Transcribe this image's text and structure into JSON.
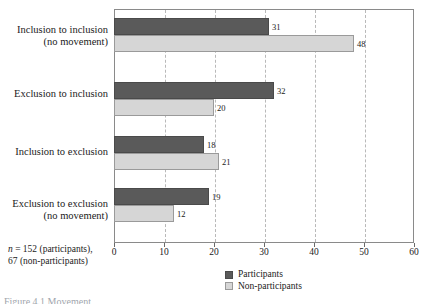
{
  "chart_data": {
    "type": "bar",
    "orientation": "horizontal",
    "title": "",
    "xlabel": "",
    "ylabel": "",
    "xlim": [
      0,
      60
    ],
    "xticks": [
      0,
      10,
      20,
      30,
      40,
      50,
      60
    ],
    "grid": "vertical-dashed",
    "legend_position": "bottom-center",
    "categories": [
      "Inclusion to inclusion\n(no movement)",
      "Exclusion to inclusion",
      "Inclusion to exclusion",
      "Exclusion to exclusion\n(no movement)"
    ],
    "series": [
      {
        "name": "Participants",
        "color": "#5a5a5a",
        "values": [
          31,
          32,
          18,
          19
        ]
      },
      {
        "name": "Non-participants",
        "color": "#d6d6d6",
        "values": [
          48,
          20,
          21,
          12
        ]
      }
    ]
  },
  "footnote": {
    "n_symbol": "n",
    "line1_rest": " = 152 (participants),",
    "line2": "67 (non-participants)"
  },
  "legend": {
    "items": [
      {
        "label": "Participants",
        "color": "#5a5a5a"
      },
      {
        "label": "Non-participants",
        "color": "#d6d6d6"
      }
    ]
  },
  "caption": {
    "text": "Figure 4.1  Movement"
  },
  "colors": {
    "participants": "#5a5a5a",
    "non_participants": "#d6d6d6",
    "frame": "#8a8a8a",
    "gridline": "#b9b9b9",
    "text": "#1a1a1a"
  }
}
